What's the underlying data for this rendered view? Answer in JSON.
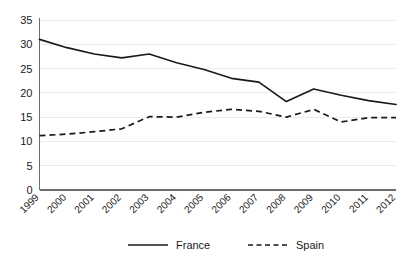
{
  "chart_data": {
    "type": "line",
    "title": "",
    "xlabel": "",
    "ylabel": "",
    "ylim": [
      0,
      35
    ],
    "ytick_values": [
      0,
      5,
      10,
      15,
      20,
      25,
      30,
      35
    ],
    "ytick_labels": [
      "0",
      "5",
      "10",
      "15",
      "20",
      "25",
      "30",
      "35"
    ],
    "grid": true,
    "legend_position": "bottom-center",
    "categories": [
      "1999",
      "2000",
      "2001",
      "2002",
      "2003",
      "2004",
      "2005",
      "2006",
      "2007",
      "2008",
      "2009",
      "2010",
      "2011",
      "2012"
    ],
    "series": [
      {
        "name": "France",
        "style": "solid",
        "color": "#1a1a1a",
        "values": [
          31.0,
          29.3,
          28.0,
          27.2,
          28.0,
          26.2,
          24.8,
          23.0,
          22.2,
          18.2,
          20.8,
          19.5,
          18.4,
          17.6
        ]
      },
      {
        "name": "Spain",
        "style": "dashed",
        "color": "#1a1a1a",
        "values": [
          11.2,
          11.5,
          12.0,
          12.6,
          15.1,
          15.0,
          16.0,
          16.6,
          16.2,
          15.0,
          16.6,
          14.0,
          14.9,
          14.9
        ]
      }
    ]
  },
  "legend": {
    "items": [
      {
        "label": "France",
        "style": "solid"
      },
      {
        "label": "Spain",
        "style": "dashed"
      }
    ]
  },
  "colors": {
    "background": "#ffffff",
    "gridline": "#ececed",
    "axis": "#6d6e70",
    "series": "#1a1a1a"
  }
}
